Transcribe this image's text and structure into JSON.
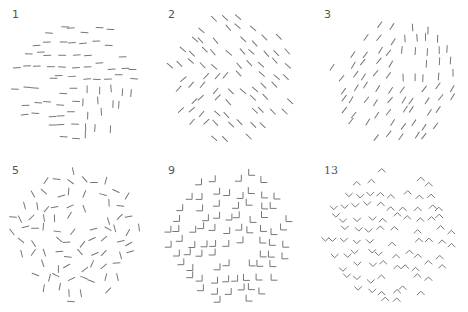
{
  "figure": {
    "background": "#ffffff",
    "glyph_color": "#777777",
    "panels": [
      {
        "label": "1",
        "x": 0,
        "y": 0,
        "cx": 76,
        "cy": 76,
        "r": 62,
        "glyph": "line",
        "background_angle": 0,
        "figure_angle": 90,
        "figure_region": "lower-right",
        "seed": 11
      },
      {
        "label": "2",
        "x": 156,
        "y": 0,
        "cx": 76,
        "cy": 76,
        "r": 64,
        "glyph": "line",
        "background_angle": 45,
        "figure_angle": -45,
        "figure_region": "lower-left",
        "seed": 23
      },
      {
        "label": "3",
        "x": 312,
        "y": 0,
        "cx": 82,
        "cy": 76,
        "r": 64,
        "glyph": "line",
        "background_angle": -55,
        "figure_angle": 90,
        "figure_region": "upper-right",
        "seed": 37
      },
      {
        "label": "5",
        "x": 0,
        "y": 156,
        "cx": 76,
        "cy": 76,
        "r": 66,
        "glyph": "line-random",
        "seed": 51
      },
      {
        "label": "9",
        "x": 156,
        "y": 156,
        "cx": 76,
        "cy": 76,
        "r": 66,
        "glyph": "corner",
        "background_angle": 0,
        "figure_angle": 90,
        "figure_region": "right",
        "seed": 67
      },
      {
        "label": "13",
        "x": 312,
        "y": 156,
        "cx": 76,
        "cy": 76,
        "r": 66,
        "glyph": "chevron",
        "background_angle": 180,
        "figure_angle": 0,
        "figure_region": "left",
        "seed": 83
      }
    ]
  }
}
